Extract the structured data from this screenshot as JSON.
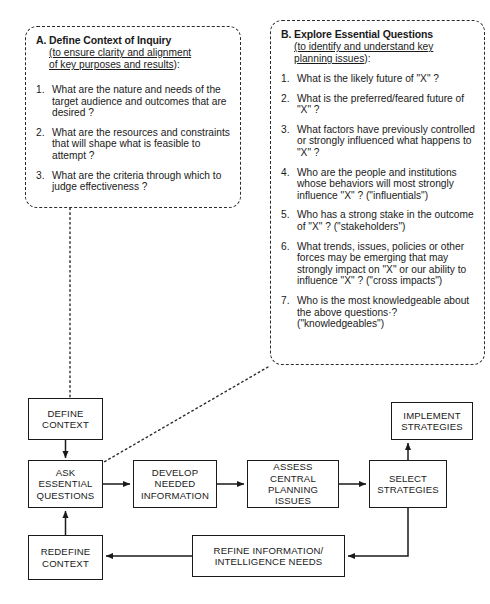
{
  "panels": [
    {
      "id": "A",
      "letter": "A.",
      "title": "Define Context of Inquiry",
      "subtitle_underlined": "(to ensure clarity and alignment of key purposes and results",
      "subtitle_line1": "(to ensure clarity and alignment",
      "subtitle_line2": "of key purposes and results",
      "subtitle_tail": "):",
      "questions": [
        {
          "num": "1.",
          "text": "What are the nature and needs of the target audience and outcomes that are desired ?"
        },
        {
          "num": "2.",
          "text": "What are the resources and constraints that will shape what is feasible to attempt ?"
        },
        {
          "num": "3.",
          "text": "What are the criteria through which to judge effectiveness ?"
        }
      ]
    },
    {
      "id": "B",
      "letter": "B.",
      "title": "Explore Essential Questions",
      "subtitle_underlined": "(to identify and understand key planning issues",
      "subtitle_line1": "(to identify and understand key",
      "subtitle_line2": "planning issues",
      "subtitle_tail": "):",
      "questions": [
        {
          "num": "1.",
          "text": "What is the likely future of \"X\" ?"
        },
        {
          "num": "2.",
          "text": "What is the preferred/feared future of \"X\" ?"
        },
        {
          "num": "3.",
          "text": "What factors have previously controlled or strongly influenced what happens to \"X\" ?"
        },
        {
          "num": "4.",
          "text": "Who are the people and institutions whose behaviors will most strongly influence \"X\" ?  (\"influentials\")"
        },
        {
          "num": "5.",
          "text": "Who has a strong stake in the outcome of \"X\" ?  (\"stakeholders\")"
        },
        {
          "num": "6.",
          "text": "What trends, issues, policies or other forces may be emerging that may strongly impact on \"X\" or our ability to influence \"X\" ? (\"cross impacts\")"
        },
        {
          "num": "7.",
          "text": "Who is the most knowledgeable about the above questions·? (\"knowledgeables\")"
        }
      ]
    }
  ],
  "flowchart": {
    "nodes": {
      "define_context": "DEFINE CONTEXT",
      "ask_essential_questions": "ASK ESSENTIAL QUESTIONS",
      "redefine_context": "REDEFINE CONTEXT",
      "develop_needed_information": "DEVELOP NEEDED INFORMATION",
      "assess_central_planning_issues": "ASSESS CENTRAL PLANNING ISSUES",
      "select_strategies": "SELECT STRATEGIES",
      "implement_strategies": "IMPLEMENT STRATEGIES",
      "refine_information": "REFINE INFORMATION/ INTELLIGENCE NEEDS"
    }
  },
  "colors": {
    "background": "#ffffff",
    "ink": "#1a1a1a",
    "dash": "#2b2b2b"
  }
}
